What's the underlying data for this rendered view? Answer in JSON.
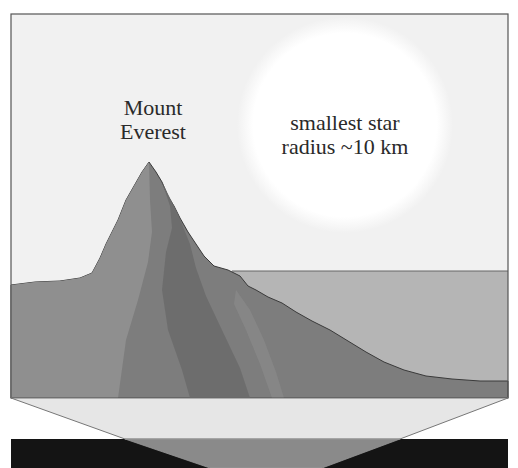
{
  "labels": {
    "mountain_line1": "Mount",
    "mountain_line2": "Everest",
    "star_line1": "smallest star",
    "star_line2": "radius ~10 km"
  },
  "colors": {
    "sky": "#f1f1f1",
    "star_glow": "#ffffff",
    "frame": "#555555",
    "mountain_light": "#8f8f8f",
    "mountain_mid": "#7d7d7d",
    "mountain_dark": "#6c6c6c",
    "sea": "#b5b5b5",
    "funnel_light": "#e6e6e6",
    "funnel_mid": "#8a8a8a",
    "band_dark": "#141414"
  }
}
